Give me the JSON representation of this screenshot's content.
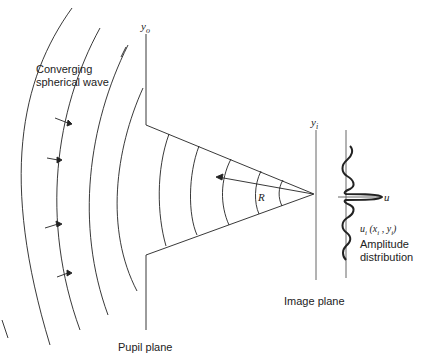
{
  "labels": {
    "wave_line1": "Converging",
    "wave_line2": "spherical wave",
    "pupil_axis": "y",
    "pupil_axis_sub": "o",
    "image_axis": "y",
    "image_axis_sub": "i",
    "radius": "R",
    "u_axis": "u",
    "amplitude_formula": "u",
    "amplitude_formula_sub": "i",
    "amplitude_formula_args": "(x",
    "amplitude_line1": "Amplitude",
    "amplitude_line2": "distribution",
    "image_plane": "Image plane",
    "pupil_plane": "Pupil plane"
  },
  "colors": {
    "line": "#222222",
    "axis": "#666666",
    "background": "#ffffff"
  }
}
